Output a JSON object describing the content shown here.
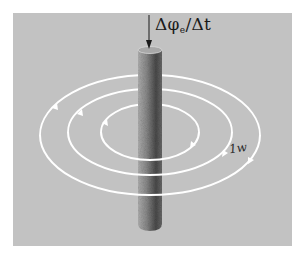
{
  "figure": {
    "flux_label": {
      "delta": "Δ",
      "phi": "φ",
      "subscript": "e",
      "slash": "/",
      "time": "Δt"
    },
    "turn_label": "1w",
    "colors": {
      "background": "#ffffff",
      "panel": "#c2c2c2",
      "rod_light": "#9a9a9a",
      "rod_dark": "#3a3a3a",
      "field_lines": "#ffffff",
      "arrow": "#1a1a1a"
    },
    "elements": {
      "rod": "vertical conductor",
      "arrow_direction": "down",
      "field_rings": 3
    }
  }
}
